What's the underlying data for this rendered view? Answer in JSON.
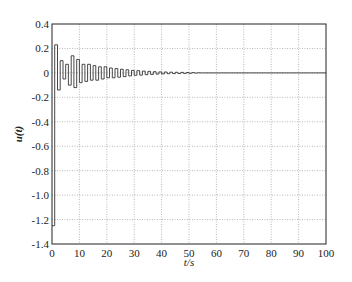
{
  "chart_data": {
    "type": "line",
    "style": "stairs",
    "title": "",
    "xlabel": "t/s",
    "ylabel": "u(t)",
    "xlim": [
      0,
      100
    ],
    "ylim": [
      -1.4,
      0.4
    ],
    "grid": true,
    "legend": null,
    "x_ticks": [
      0,
      10,
      20,
      30,
      40,
      50,
      60,
      70,
      80,
      90,
      100
    ],
    "x_tick_labels": [
      "0",
      "10",
      "20",
      "30",
      "40",
      "50",
      "60",
      "70",
      "80",
      "90",
      "100"
    ],
    "y_ticks": [
      0.4,
      0.2,
      0,
      -0.2,
      -0.4,
      -0.6,
      -0.8,
      -1.0,
      -1.2,
      -1.4
    ],
    "y_tick_labels": [
      "0.4",
      "0.2",
      "0",
      "-0.2",
      "-0.4",
      "-0.6",
      "-0.8",
      "-1.0",
      "-1.2",
      "-1.4"
    ],
    "series": [
      {
        "name": "u(t)",
        "color": "#333333",
        "x": [
          0,
          1,
          2,
          3,
          4,
          5,
          6,
          7,
          8,
          9,
          10,
          11,
          12,
          13,
          14,
          15,
          16,
          17,
          18,
          19,
          20,
          21,
          22,
          23,
          24,
          25,
          26,
          27,
          28,
          29,
          30,
          31,
          32,
          33,
          34,
          35,
          36,
          37,
          38,
          39,
          40,
          41,
          42,
          43,
          44,
          45,
          46,
          47,
          48,
          49,
          50,
          51,
          52,
          53,
          54,
          55,
          100
        ],
        "values": [
          -1.25,
          0.23,
          -0.14,
          0.1,
          -0.05,
          0.07,
          -0.1,
          0.14,
          -0.12,
          0.11,
          -0.08,
          0.07,
          -0.07,
          0.07,
          -0.06,
          0.06,
          -0.06,
          0.05,
          -0.05,
          0.05,
          -0.04,
          0.04,
          -0.04,
          0.035,
          -0.035,
          0.03,
          -0.03,
          0.025,
          -0.025,
          0.02,
          -0.02,
          0.018,
          -0.018,
          0.015,
          -0.015,
          0.012,
          -0.012,
          0.01,
          -0.01,
          0.008,
          -0.008,
          0.007,
          -0.007,
          0.006,
          -0.006,
          0.005,
          -0.005,
          0.004,
          -0.004,
          0.003,
          -0.003,
          0.002,
          -0.002,
          0.001,
          0,
          0,
          0
        ]
      }
    ]
  }
}
